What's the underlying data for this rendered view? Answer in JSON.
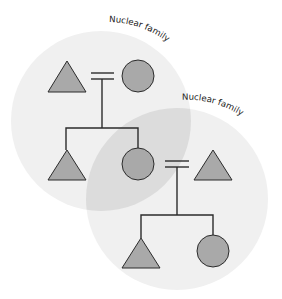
{
  "diagram": {
    "colors": {
      "background": "#ffffff",
      "family_fill": "#f0f0f0",
      "overlap_fill": "#dcdcdc",
      "shape_fill": "#a9a9a9",
      "stroke": "#2b2b2b",
      "text": "#222222"
    },
    "families": [
      {
        "id": "family-1",
        "label": "Nuclear family",
        "cx": 101,
        "cy": 121,
        "r": 90
      },
      {
        "id": "family-2",
        "label": "Nuclear family",
        "cx": 177,
        "cy": 199,
        "r": 91
      }
    ],
    "legend_symbols": {
      "triangle": "male",
      "circle": "female",
      "double-line": "marriage"
    },
    "people": [
      {
        "id": "gen1-male",
        "shape": "triangle",
        "cx": 67,
        "top": 61,
        "base": 92,
        "half": 19
      },
      {
        "id": "gen1-female",
        "shape": "circle",
        "cx": 138,
        "cy": 76,
        "r": 16
      },
      {
        "id": "gen2-son",
        "shape": "triangle",
        "cx": 67,
        "top": 150,
        "base": 180,
        "half": 19
      },
      {
        "id": "gen2-daughter",
        "shape": "circle",
        "cx": 138,
        "cy": 164,
        "r": 16
      },
      {
        "id": "gen2-husband",
        "shape": "triangle",
        "cx": 213,
        "top": 150,
        "base": 180,
        "half": 19
      },
      {
        "id": "gen3-son",
        "shape": "triangle",
        "cx": 141,
        "top": 238,
        "base": 268,
        "half": 19
      },
      {
        "id": "gen3-daughter",
        "shape": "circle",
        "cx": 213,
        "cy": 251,
        "r": 16
      }
    ]
  }
}
